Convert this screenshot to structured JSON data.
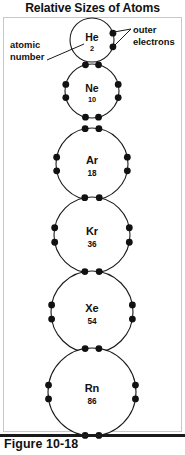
{
  "title": "Relative Sizes of Atoms",
  "caption": "Figure 10-18",
  "annotations": {
    "atomic_number": "atomic\nnumber",
    "atomic_number_line1": "atomic",
    "atomic_number_line2": "number",
    "outer_electrons_line1": "outer",
    "outer_electrons_line2": "electrons"
  },
  "colors": {
    "stroke": "#1a1a1a",
    "electron": "#111111",
    "background": "#ffffff",
    "frame": "#c8c8c8"
  },
  "chart_data": {
    "type": "diagram",
    "title": "Relative Sizes of Atoms",
    "atoms": [
      {
        "symbol": "He",
        "atomic_number": "2",
        "outer_electrons": 2,
        "cx": 92,
        "cy": 40,
        "r": 22,
        "electron_angles": [
          -18,
          18
        ]
      },
      {
        "symbol": "Ne",
        "atomic_number": "10",
        "outer_electrons": 8,
        "cx": 92,
        "cy": 91,
        "r": 27,
        "electron_angles": [
          -104,
          -76,
          -14,
          14,
          76,
          104,
          166,
          194
        ]
      },
      {
        "symbol": "Ar",
        "atomic_number": "18",
        "outer_electrons": 8,
        "cx": 92,
        "cy": 164,
        "r": 36,
        "electron_angles": [
          -101,
          -79,
          -11,
          11,
          79,
          101,
          169,
          191
        ]
      },
      {
        "symbol": "Kr",
        "atomic_number": "36",
        "outer_electrons": 8,
        "cx": 92,
        "cy": 235,
        "r": 38,
        "electron_angles": [
          -101,
          -79,
          -11,
          11,
          79,
          101,
          169,
          191
        ]
      },
      {
        "symbol": "Xe",
        "atomic_number": "54",
        "outer_electrons": 8,
        "cx": 92,
        "cy": 312,
        "r": 41,
        "electron_angles": [
          -100,
          -80,
          -10,
          10,
          80,
          100,
          170,
          190
        ]
      },
      {
        "symbol": "Rn",
        "atomic_number": "86",
        "outer_electrons": 8,
        "cx": 92,
        "cy": 392,
        "r": 44,
        "electron_angles": [
          -99,
          -81,
          -9,
          9,
          81,
          99,
          171,
          189
        ]
      }
    ],
    "electron_radius": 3.4,
    "labels": [
      {
        "text": "atomic number",
        "points_to": "He atomic number 2"
      },
      {
        "text": "outer electrons",
        "points_to": "He outer electron dots"
      }
    ]
  }
}
